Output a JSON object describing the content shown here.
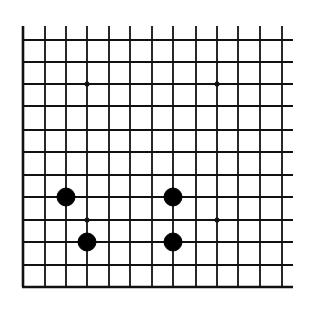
{
  "diagram": {
    "type": "go-board-fragment",
    "background": "#ffffff",
    "line_color": "#111111",
    "vertical_lines_x": [
      23,
      45,
      66,
      87,
      109,
      130,
      152,
      173,
      196,
      217,
      238,
      260,
      282
    ],
    "horizontal_lines_y": [
      40,
      62,
      84,
      106,
      130,
      152,
      175,
      197,
      220,
      242,
      265,
      287
    ],
    "vertical_top_y": 26,
    "horizontal_right_x": 293,
    "thick_edges": [
      "left",
      "bottom"
    ],
    "star_points": [
      {
        "x": 87,
        "y": 84
      },
      {
        "x": 217,
        "y": 84
      },
      {
        "x": 87,
        "y": 220
      },
      {
        "x": 217,
        "y": 220
      }
    ],
    "stones": [
      {
        "color": "black",
        "x": 66,
        "y": 197
      },
      {
        "color": "black",
        "x": 87,
        "y": 242
      },
      {
        "color": "black",
        "x": 173,
        "y": 197
      },
      {
        "color": "black",
        "x": 173,
        "y": 242
      }
    ],
    "stone_radius": 9,
    "star_radius": 2.5
  }
}
